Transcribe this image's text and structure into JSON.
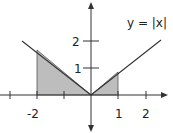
{
  "figure": {
    "function_label": "y = |x|",
    "x_ticks": [
      "-2",
      "1",
      "2"
    ],
    "y_ticks": [
      "1",
      "2"
    ],
    "shaded_regions": [
      {
        "from": -2,
        "to": 0
      },
      {
        "from": 0,
        "to": 1
      }
    ],
    "colors": {
      "line": "#333333",
      "fill": "#bdbdbd",
      "axis": "#333333"
    }
  }
}
